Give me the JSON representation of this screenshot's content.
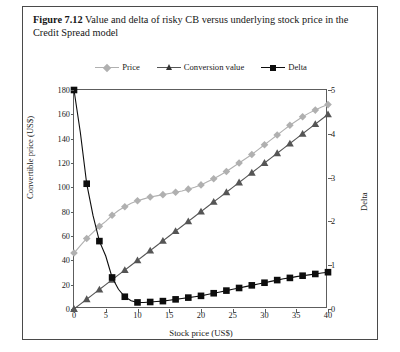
{
  "caption": {
    "figure_number": "Figure 7.12",
    "text": "Value and delta of risky CB versus underlying stock price in the Credit Spread model"
  },
  "colors": {
    "price": "#b0b0b0",
    "conversion_value": "#555555",
    "delta": "#0d0d0d",
    "axis": "#5d5d5d",
    "border": "#4a4a4a",
    "text": "#1a1a1a"
  },
  "legend": {
    "position": "top-center",
    "entries": [
      {
        "label": "Price",
        "marker": "diamond",
        "color": "#b0b0b0"
      },
      {
        "label": "Conversion value",
        "marker": "triangle",
        "color": "#555555"
      },
      {
        "label": "Delta",
        "marker": "square",
        "color": "#0d0d0d"
      }
    ]
  },
  "chart_data": {
    "type": "line",
    "title": "Value and delta of risky CB versus underlying stock price in the Credit Spread model",
    "xlabel": "Stock price (US$)",
    "ylabel": "Convertible price (US$)",
    "ylabel_right": "Delta",
    "xlim": [
      0,
      40
    ],
    "ylim": [
      0,
      180
    ],
    "ylim_right": [
      0,
      5
    ],
    "xticks": [
      0,
      5,
      10,
      15,
      20,
      25,
      30,
      35,
      40
    ],
    "yticks": [
      0,
      20,
      40,
      60,
      80,
      100,
      120,
      140,
      160,
      180
    ],
    "yticks_right": [
      0,
      1,
      2,
      3,
      4,
      5
    ],
    "grid": false,
    "x": [
      0,
      1,
      2,
      3,
      4,
      5,
      6,
      7,
      8,
      9,
      10,
      11,
      12,
      13,
      14,
      15,
      16,
      17,
      18,
      19,
      20,
      21,
      22,
      23,
      24,
      25,
      26,
      27,
      28,
      29,
      30,
      31,
      32,
      33,
      34,
      35,
      36,
      37,
      38,
      39,
      40
    ],
    "series": [
      {
        "name": "Price",
        "axis": "left",
        "marker": "diamond",
        "color": "#b0b0b0",
        "values": [
          46,
          52,
          58,
          63,
          68,
          72,
          77,
          81,
          84,
          87,
          89,
          90.5,
          92,
          93,
          94,
          95,
          96,
          97,
          98.5,
          100,
          102,
          104.5,
          107,
          110,
          113,
          116.5,
          120,
          123.5,
          127,
          131,
          135,
          139,
          143,
          147,
          151,
          154.5,
          158,
          161,
          163.5,
          166,
          168
        ]
      },
      {
        "name": "Conversion value",
        "axis": "left",
        "marker": "triangle",
        "color": "#555555",
        "values": [
          0,
          4,
          8,
          12,
          16,
          20,
          24,
          28,
          32,
          36,
          40,
          44,
          48,
          52,
          56,
          60,
          64,
          68,
          72,
          76,
          80,
          84,
          88,
          92,
          96,
          100,
          104,
          108,
          112,
          116,
          120,
          124,
          128,
          132,
          136,
          140,
          144,
          148,
          152,
          156,
          160
        ]
      },
      {
        "name": "Delta",
        "axis": "right",
        "marker": "square",
        "color": "#0d0d0d",
        "values": [
          5.0,
          4.03,
          2.86,
          2.13,
          1.55,
          1.21,
          0.72,
          0.45,
          0.28,
          0.19,
          0.15,
          0.15,
          0.16,
          0.17,
          0.18,
          0.2,
          0.22,
          0.24,
          0.26,
          0.28,
          0.3,
          0.33,
          0.36,
          0.39,
          0.42,
          0.45,
          0.48,
          0.51,
          0.54,
          0.57,
          0.6,
          0.63,
          0.66,
          0.69,
          0.71,
          0.74,
          0.76,
          0.78,
          0.8,
          0.82,
          0.84
        ]
      }
    ]
  }
}
